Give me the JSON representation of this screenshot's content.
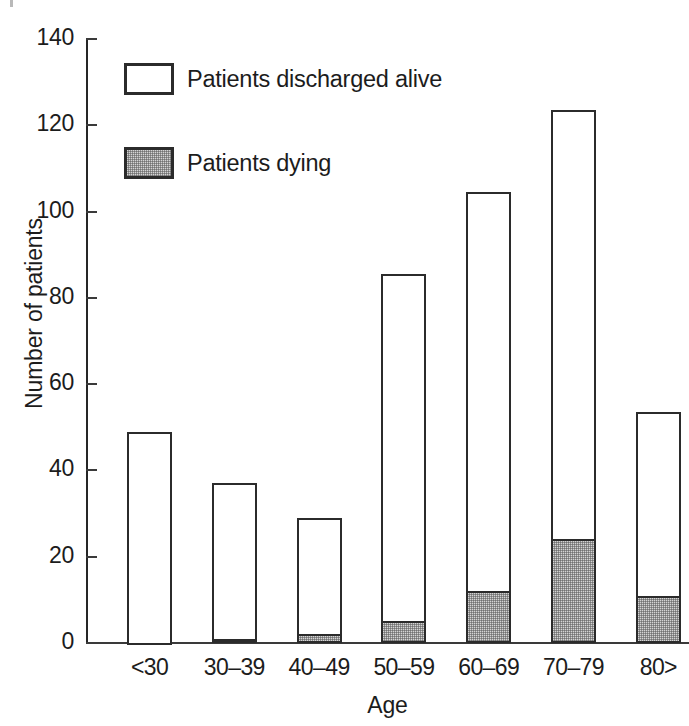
{
  "chart_data": {
    "type": "bar",
    "subtype": "stacked-vertical",
    "title": "",
    "xlabel": "Age",
    "ylabel": "Number of patients",
    "categories": [
      "<30",
      "30–39",
      "40–49",
      "50–59",
      "60–69",
      "70–79",
      "80>"
    ],
    "series": [
      {
        "name": "Patients dying",
        "values": [
          0,
          1,
          2,
          5,
          12,
          24,
          11
        ],
        "fill": "stipple-gray",
        "color": "#d4d4d4"
      },
      {
        "name": "Patients discharged alive",
        "values": [
          49,
          36,
          27,
          80.5,
          92.5,
          99.5,
          42.5
        ],
        "fill": "white",
        "color": "#ffffff"
      }
    ],
    "totals": [
      49,
      37,
      29,
      85.5,
      104.5,
      123.5,
      53.5
    ],
    "ylim": [
      0,
      140
    ],
    "yticks": [
      0,
      20,
      40,
      60,
      80,
      100,
      120,
      140
    ],
    "ytick_labels": [
      "0",
      "20",
      "40",
      "60",
      "80",
      "100",
      "120",
      "140"
    ],
    "grid": false,
    "legend_position": "upper-left-inside",
    "outline_color": "#2b2b2b",
    "axis_color": "#3a3a3a"
  },
  "legend": {
    "entries": [
      {
        "label": "Patients discharged alive",
        "swatch": "white-square-swatch"
      },
      {
        "label": "Patients dying",
        "swatch": "stippled-square-swatch"
      }
    ]
  },
  "axes": {
    "x_title": "Age",
    "y_title": "Number of patients"
  }
}
